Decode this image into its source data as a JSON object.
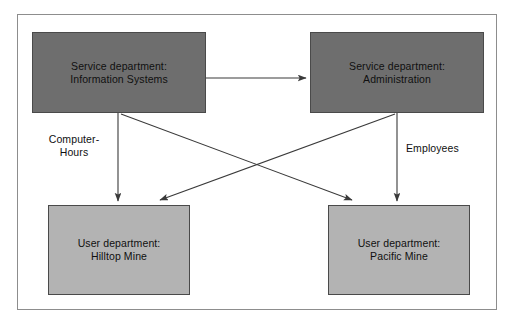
{
  "diagram": {
    "frame": {
      "border_color": "#8d8d8d",
      "background_color": "#ffffff"
    },
    "colors": {
      "service_box_fill": "#6e6e6e",
      "user_box_fill": "#b3b3b3",
      "box_border": "#4a4a4a",
      "connector": "#3a3a3a",
      "text": "#101010"
    },
    "nodes": [
      {
        "id": "information-systems",
        "kind": "service",
        "line1": "Service department:",
        "line2": "Information Systems",
        "label": "Service department:\nInformation Systems",
        "x": 32,
        "y": 32,
        "width": 174,
        "height": 81
      },
      {
        "id": "administration",
        "kind": "service",
        "line1": "Service department:",
        "line2": "Administration",
        "label": "Service department:\nAdministration",
        "x": 310,
        "y": 32,
        "width": 174,
        "height": 81
      },
      {
        "id": "hilltop-mine",
        "kind": "user",
        "line1": "User department:",
        "line2": "Hilltop Mine",
        "label": "User department:\nHilltop Mine",
        "x": 48,
        "y": 205,
        "width": 142,
        "height": 90
      },
      {
        "id": "pacific-mine",
        "kind": "user",
        "line1": "User department:",
        "line2": "Pacific Mine",
        "label": "User department:\nPacific Mine",
        "x": 328,
        "y": 205,
        "width": 142,
        "height": 90
      }
    ],
    "edges": [
      {
        "id": "is-to-admin",
        "from": "information-systems",
        "to": "administration",
        "label": ""
      },
      {
        "id": "is-to-hilltop",
        "from": "information-systems",
        "to": "hilltop-mine",
        "label": ""
      },
      {
        "id": "is-to-pacific",
        "from": "information-systems",
        "to": "pacific-mine",
        "label": ""
      },
      {
        "id": "admin-to-hilltop",
        "from": "administration",
        "to": "hilltop-mine",
        "label": ""
      },
      {
        "id": "admin-to-pacific",
        "from": "administration",
        "to": "pacific-mine",
        "label": ""
      }
    ],
    "edge_labels": {
      "left": "Computer-\nHours",
      "left_line1": "Computer-",
      "left_line2": "Hours",
      "right": "Employees"
    }
  }
}
